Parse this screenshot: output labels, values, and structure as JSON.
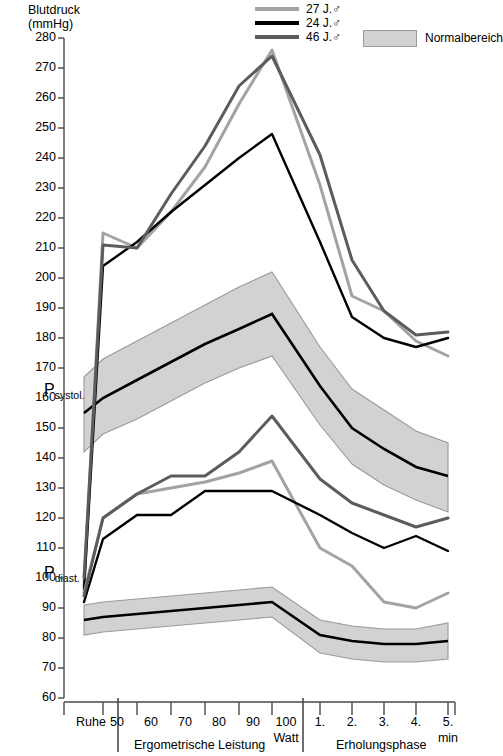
{
  "chart_data": {
    "type": "line",
    "title": "Blutdruck (mmHg)",
    "ylabel_line1": "Blutdruck",
    "ylabel_line2": "(mmHg)",
    "xlabel": "",
    "ylim": [
      60,
      280
    ],
    "ytick_step": 10,
    "yticks": [
      280,
      270,
      260,
      250,
      240,
      230,
      220,
      210,
      200,
      190,
      180,
      170,
      160,
      150,
      140,
      130,
      120,
      110,
      100,
      90,
      80,
      70,
      60
    ],
    "grid": false,
    "legend_position": "top-right",
    "x_categories": [
      "Ruhe",
      "50",
      "60",
      "70",
      "80",
      "90",
      "100",
      "1.",
      "2.",
      "3.",
      "4.",
      "5."
    ],
    "x_units": [
      "",
      "Watt",
      "min"
    ],
    "x_groups": [
      {
        "label": "Ruhe",
        "span": [
          "Ruhe"
        ]
      },
      {
        "label": "Ergometrische Leistung",
        "span": [
          "50",
          "60",
          "70",
          "80",
          "90",
          "100"
        ]
      },
      {
        "label": "Erholungsphase",
        "span": [
          "1.",
          "2.",
          "3.",
          "4.",
          "5."
        ]
      }
    ],
    "series": [
      {
        "name": "27 J.",
        "sex": "male",
        "color": "#a3a3a3",
        "parameter": "systolisch",
        "values": [
          97,
          215,
          210,
          222,
          237,
          258,
          276,
          231,
          194,
          189,
          179,
          174
        ]
      },
      {
        "name": "24 J.",
        "sex": "male",
        "color": "#000000",
        "parameter": "systolisch",
        "values": [
          96,
          204,
          212,
          222,
          231,
          240,
          248,
          212,
          187,
          180,
          177,
          180
        ]
      },
      {
        "name": "46 J.",
        "sex": "male",
        "color": "#5c5c5c",
        "parameter": "systolisch",
        "values": [
          100,
          211,
          210,
          228,
          244,
          264,
          274,
          241,
          206,
          189,
          181,
          182
        ]
      },
      {
        "name": "27 J.",
        "sex": "male",
        "color": "#a3a3a3",
        "parameter": "diastolisch",
        "values": [
          95,
          120,
          128,
          130,
          132,
          135,
          139,
          110,
          104,
          92,
          90,
          95
        ]
      },
      {
        "name": "24 J.",
        "sex": "male",
        "color": "#000000",
        "parameter": "diastolisch",
        "values": [
          92,
          113,
          121,
          121,
          129,
          129,
          129,
          121,
          115,
          110,
          114,
          109
        ]
      },
      {
        "name": "46 J.",
        "sex": "male",
        "color": "#5c5c5c",
        "parameter": "diastolisch",
        "values": [
          94,
          120,
          128,
          134,
          134,
          142,
          154,
          133,
          125,
          121,
          117,
          120
        ]
      }
    ],
    "normal_range": {
      "label": "Normalbereich",
      "fill": "#d2d2d2",
      "edge": "#9a9a9a",
      "mean_color": "#000000",
      "systolic": {
        "mean": [
          155,
          160,
          166,
          172,
          178,
          183,
          188,
          164,
          150,
          143,
          137,
          134
        ],
        "upper": [
          167,
          173,
          179,
          185,
          191,
          197,
          202,
          177,
          163,
          156,
          149,
          145
        ],
        "lower": [
          142,
          148,
          153,
          159,
          165,
          170,
          174,
          151,
          138,
          131,
          126,
          122
        ]
      },
      "diastolic": {
        "mean": [
          86,
          87,
          88,
          89,
          90,
          91,
          92,
          81,
          79,
          78,
          78,
          79
        ],
        "upper": [
          91,
          92,
          93,
          94,
          95,
          96,
          97,
          86,
          84,
          83,
          83,
          85
        ],
        "lower": [
          81,
          82,
          83,
          84,
          85,
          86,
          87,
          75,
          73,
          72,
          72,
          73
        ]
      }
    },
    "annotations": [
      {
        "text": "P_systol.",
        "display": "P",
        "sub": "systol.",
        "value_y": 162
      },
      {
        "text": "P_diast.",
        "display": "P",
        "sub": "diast.",
        "value_y": 101
      }
    ]
  },
  "legend": {
    "entries": [
      {
        "label": "27 J.♂",
        "color": "#a3a3a3"
      },
      {
        "label": "24 J.♂",
        "color": "#000000"
      },
      {
        "label": "46 J.♂",
        "color": "#5c5c5c"
      }
    ],
    "band_label": "Normalbereich"
  },
  "axes": {
    "y_title_line1": "Blutdruck",
    "y_title_line2": "(mmHg)",
    "x_rest_label": "Ruhe",
    "x_watt_unit": "Watt",
    "x_min_unit": "min",
    "x_group_ergo": "Ergometrische Leistung",
    "x_group_recovery": "Erholungsphase"
  },
  "labels": {
    "p_systol_main": "P",
    "p_systol_sub": "systol.",
    "p_diast_main": "P",
    "p_diast_sub": "diast."
  }
}
